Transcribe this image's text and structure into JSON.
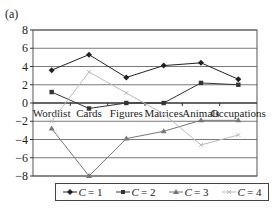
{
  "panel_label": "(a)",
  "chart_data": {
    "type": "line",
    "title": "",
    "xlabel": "",
    "ylabel": "",
    "categories": [
      "Wordlist",
      "Cards",
      "Figures",
      "Matrices",
      "Animals",
      "Occupations"
    ],
    "ylim": [
      -8,
      8
    ],
    "yticks": [
      8,
      6,
      4,
      2,
      0,
      -2,
      -4,
      -6,
      -8
    ],
    "grid": true,
    "legend_position": "bottom",
    "series": [
      {
        "name": "C = 1",
        "marker": "diamond",
        "color": "#222222",
        "values": [
          3.6,
          5.3,
          2.8,
          4.1,
          4.4,
          2.6
        ]
      },
      {
        "name": "C = 2",
        "marker": "square",
        "color": "#333333",
        "values": [
          1.2,
          -0.6,
          0.0,
          0.0,
          2.2,
          2.0
        ]
      },
      {
        "name": "C = 3",
        "marker": "triangle",
        "color": "#777777",
        "values": [
          -2.8,
          -8.0,
          -3.9,
          -3.1,
          -1.9,
          -1.9
        ]
      },
      {
        "name": "C = 4",
        "marker": "cross",
        "color": "#bbbbbb",
        "values": [
          -2.0,
          3.4,
          1.1,
          -1.2,
          -4.6,
          -3.5
        ]
      }
    ]
  },
  "legend": {
    "items": [
      {
        "prefix": "C",
        "suffix": " = 1"
      },
      {
        "prefix": "C",
        "suffix": " = 2"
      },
      {
        "prefix": "C",
        "suffix": " = 3"
      },
      {
        "prefix": "C",
        "suffix": " = 4"
      }
    ]
  }
}
